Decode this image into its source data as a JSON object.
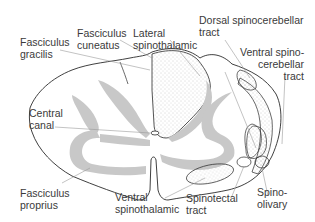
{
  "diagram": {
    "type": "anatomical cross-section",
    "colors": {
      "outline": "#2a2a2a",
      "grey_matter": "#c8c8c8",
      "leader_line": "#9a9a9a",
      "stipple": "#9a9a9a",
      "label_text": "#3a3a3a",
      "background": "#ffffff"
    }
  },
  "labels": {
    "fasciculus_gracilis": "Fasciculus\ngracilis",
    "fasciculus_cuneatus": "Fasciculus\ncuneatus",
    "lateral_spinothalamic": "Lateral\nspinothalamic",
    "dorsal_spinocerebellar": "Dorsal spinocerebellar\ntract",
    "ventral_spinocerebellar": "Ventral spino-\ncerebellar\ntract",
    "central_canal": "Central\ncanal",
    "fasciculus_proprius": "Fasciculus\nproprius",
    "ventral_spinothalamic": "Ventral\nspinothalamic",
    "spinotectal_tract": "Spinotectal\ntract",
    "spino_olivary": "Spino-\nolivary"
  }
}
